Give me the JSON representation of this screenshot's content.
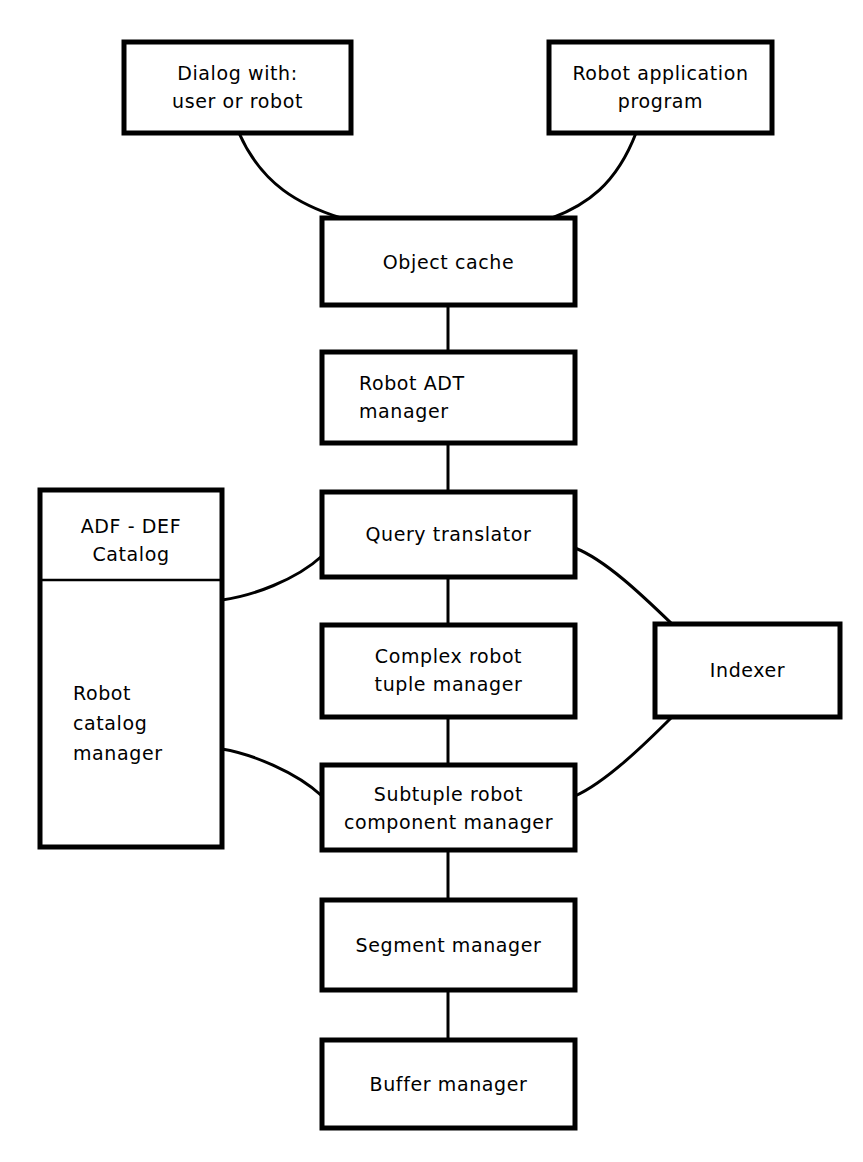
{
  "diagram": {
    "background_color": "#ffffff",
    "line_color": "#000000",
    "nodes": [
      {
        "id": "dialog",
        "name": "dialog-box",
        "lines": [
          "Dialog with:",
          "user or robot"
        ],
        "align": "center",
        "x": 124,
        "y": 42,
        "w": 227,
        "h": 91
      },
      {
        "id": "robot-application",
        "name": "robot-application-program-box",
        "lines": [
          "Robot application",
          "program"
        ],
        "align": "center",
        "x": 549,
        "y": 42,
        "w": 223,
        "h": 91
      },
      {
        "id": "object-cache",
        "name": "object-cache-box",
        "lines": [
          "Object  cache"
        ],
        "align": "center",
        "x": 322,
        "y": 218,
        "w": 253,
        "h": 87
      },
      {
        "id": "robot-adt-manager",
        "name": "robot-adt-manager-box",
        "lines": [
          "Robot ADT",
          "manager"
        ],
        "align": "left",
        "x": 322,
        "y": 352,
        "w": 253,
        "h": 91
      },
      {
        "id": "query-translator",
        "name": "query-translator-box",
        "lines": [
          "Query  translator"
        ],
        "align": "center",
        "x": 322,
        "y": 492,
        "w": 253,
        "h": 85
      },
      {
        "id": "complex-robot-tuple-manager",
        "name": "complex-robot-tuple-manager-box",
        "lines": [
          "Complex  robot",
          "tuple  manager"
        ],
        "align": "center",
        "x": 322,
        "y": 625,
        "w": 253,
        "h": 92
      },
      {
        "id": "subtuple-robot-component-manager",
        "name": "subtuple-robot-component-manager-box",
        "lines": [
          "Subtuple  robot",
          "component  manager"
        ],
        "align": "center",
        "x": 322,
        "y": 765,
        "w": 253,
        "h": 85
      },
      {
        "id": "segment-manager",
        "name": "segment-manager-box",
        "lines": [
          "Segment  manager"
        ],
        "align": "center",
        "x": 322,
        "y": 900,
        "w": 253,
        "h": 90
      },
      {
        "id": "buffer-manager",
        "name": "buffer-manager-box",
        "lines": [
          "Buffer  manager"
        ],
        "align": "center",
        "x": 322,
        "y": 1040,
        "w": 253,
        "h": 88
      },
      {
        "id": "indexer",
        "name": "indexer-box",
        "lines": [
          "Indexer"
        ],
        "align": "center",
        "x": 655,
        "y": 624,
        "w": 185,
        "h": 93
      },
      {
        "id": "catalog-compound",
        "name": "robot-catalog-compound-box",
        "header_lines": [
          "ADF - DEF",
          "Catalog"
        ],
        "body_lines": [
          "Robot",
          "catalog",
          "manager"
        ],
        "align_header": "center",
        "align_body": "left",
        "x": 40,
        "y": 490,
        "w": 182,
        "h": 357,
        "divider_y": 580
      }
    ],
    "edges": [
      {
        "name": "edge-dialog-to-object-cache",
        "type": "curve",
        "from": "dialog",
        "to": "object-cache"
      },
      {
        "name": "edge-robot-application-to-object-cache",
        "type": "curve",
        "from": "robot-application",
        "to": "object-cache"
      },
      {
        "name": "edge-object-cache-to-robot-adt-manager",
        "type": "line",
        "from": "object-cache",
        "to": "robot-adt-manager"
      },
      {
        "name": "edge-robot-adt-manager-to-query-translator",
        "type": "line",
        "from": "robot-adt-manager",
        "to": "query-translator"
      },
      {
        "name": "edge-query-translator-to-complex-robot-tuple-manager",
        "type": "line",
        "from": "query-translator",
        "to": "complex-robot-tuple-manager"
      },
      {
        "name": "edge-complex-to-subtuple",
        "type": "line",
        "from": "complex-robot-tuple-manager",
        "to": "subtuple-robot-component-manager"
      },
      {
        "name": "edge-subtuple-to-segment-manager",
        "type": "line",
        "from": "subtuple-robot-component-manager",
        "to": "segment-manager"
      },
      {
        "name": "edge-segment-manager-to-buffer-manager",
        "type": "line",
        "from": "segment-manager",
        "to": "buffer-manager"
      },
      {
        "name": "edge-catalog-to-query-translator",
        "type": "curve",
        "from": "catalog-compound",
        "to": "query-translator"
      },
      {
        "name": "edge-catalog-to-subtuple",
        "type": "curve",
        "from": "catalog-compound",
        "to": "subtuple-robot-component-manager"
      },
      {
        "name": "edge-query-translator-to-indexer",
        "type": "curve",
        "from": "query-translator",
        "to": "indexer"
      },
      {
        "name": "edge-indexer-to-subtuple",
        "type": "curve",
        "from": "indexer",
        "to": "subtuple-robot-component-manager"
      }
    ]
  }
}
